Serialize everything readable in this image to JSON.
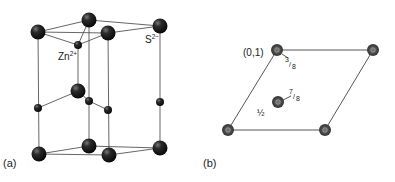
{
  "panel_a": {
    "label": "(a)",
    "zn_label": "Zn",
    "zn_charge": "2+",
    "s_label": "S",
    "s_charge": "2−"
  },
  "panel_b": {
    "label": "(b)",
    "corner_label": "(0,1)",
    "frac_3_8_num": "3",
    "frac_3_8_den": "8",
    "frac_7_8_num": "7",
    "frac_7_8_den": "8",
    "half_label": "½"
  },
  "colors": {
    "atom": "#1a1a1a",
    "line": "#555555",
    "atom_b": "#4a4a4a"
  }
}
